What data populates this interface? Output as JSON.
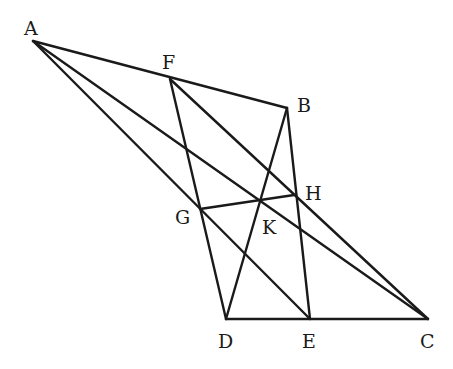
{
  "diagram": {
    "type": "geometry-figure",
    "points": {
      "A": {
        "x": 33,
        "y": 41,
        "label": "A",
        "lx": 24,
        "ly": 35
      },
      "F": {
        "x": 170,
        "y": 79,
        "label": "F",
        "lx": 162,
        "ly": 69
      },
      "B": {
        "x": 287,
        "y": 108,
        "label": "B",
        "lx": 297,
        "ly": 112
      },
      "H": {
        "x": 294,
        "y": 195,
        "label": "H",
        "lx": 305,
        "ly": 200
      },
      "G": {
        "x": 200,
        "y": 209,
        "label": "G",
        "lx": 175,
        "ly": 224
      },
      "K": {
        "x": 260,
        "y": 200,
        "label": "K",
        "lx": 262,
        "ly": 234
      },
      "D": {
        "x": 226,
        "y": 319,
        "label": "D",
        "lx": 218,
        "ly": 348
      },
      "E": {
        "x": 310,
        "y": 319,
        "label": "E",
        "lx": 302,
        "ly": 348
      },
      "C": {
        "x": 428,
        "y": 319,
        "label": "C",
        "lx": 420,
        "ly": 348
      }
    },
    "segments": [
      [
        "A",
        "B"
      ],
      [
        "A",
        "C"
      ],
      [
        "A",
        "E"
      ],
      [
        "F",
        "D"
      ],
      [
        "F",
        "C"
      ],
      [
        "B",
        "D"
      ],
      [
        "B",
        "E"
      ],
      [
        "G",
        "H"
      ],
      [
        "D",
        "C"
      ]
    ]
  }
}
